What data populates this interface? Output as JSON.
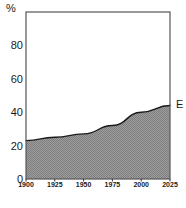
{
  "chart_data": {
    "type": "area",
    "title": "",
    "subtitle": "",
    "xlabel": "",
    "ylabel": "%",
    "unit_label": "%",
    "x": [
      1900,
      1925,
      1950,
      1975,
      2000,
      2025
    ],
    "categories": [
      "1900",
      "1925",
      "1950",
      "1975",
      "2000",
      "2025"
    ],
    "series": [
      {
        "name": "E",
        "values": [
          23,
          25,
          27,
          32,
          40,
          44
        ],
        "fill": "#8f8f8f",
        "line": "#1a1a1a"
      }
    ],
    "xlim": [
      1900,
      2025
    ],
    "ylim": [
      0,
      100
    ],
    "x_ticks": [
      1900,
      1925,
      1950,
      1975,
      2000,
      2025
    ],
    "x_tick_labels": [
      "1900",
      "1925",
      "1950",
      "1975",
      "2000",
      "2025"
    ],
    "y_ticks": [
      0,
      20,
      40,
      60,
      80
    ],
    "y_tick_labels": [
      "0",
      "20",
      "40",
      "60",
      "80"
    ],
    "grid": false,
    "legend_position": "right-edge-inline",
    "annotations": [
      {
        "text": "E",
        "x": 2025,
        "y": 44,
        "position": "right-of-plot"
      }
    ]
  },
  "axes": {
    "y_label_top": "%",
    "y_ticks": [
      {
        "value": 80,
        "label": "80"
      },
      {
        "value": 60,
        "label": "60"
      },
      {
        "value": 40,
        "label": "40"
      },
      {
        "value": 20,
        "label": "20"
      },
      {
        "value": 0,
        "label": "0"
      }
    ],
    "x_ticks": [
      {
        "value": 1900,
        "label": "1900"
      },
      {
        "value": 1925,
        "label": "1925"
      },
      {
        "value": 1950,
        "label": "1950"
      },
      {
        "value": 1975,
        "label": "1975"
      },
      {
        "value": 2000,
        "label": "2000"
      },
      {
        "value": 2025,
        "label": "2025"
      }
    ]
  },
  "series_label": {
    "text": "E"
  },
  "colors": {
    "frame": "#4d4d4d",
    "axis_text": "#1a1a1a",
    "area_fill": "#8f8f8f",
    "area_line": "#1a1a1a",
    "background": "#ffffff"
  }
}
